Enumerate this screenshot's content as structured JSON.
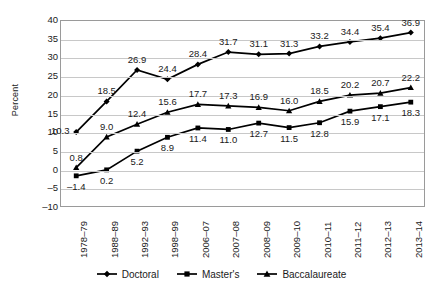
{
  "chart_data": {
    "type": "line",
    "title": "",
    "subtitle": "",
    "xlabel": "",
    "ylabel": "Percent",
    "ylim": [
      -10,
      40
    ],
    "ytick_values": [
      40,
      35,
      30,
      25,
      20,
      15,
      10,
      5,
      0,
      -5,
      -10
    ],
    "ytick_labels": [
      "40",
      "35",
      "30",
      "25",
      "20",
      "15",
      "10",
      "5",
      "0",
      "–5",
      "–10"
    ],
    "grid": "horizontal",
    "legend_position": "bottom-center",
    "categories": [
      "1978–79",
      "1988–89",
      "1992–93",
      "1998–99",
      "2006–07",
      "2007–08",
      "2008–09",
      "2009–10",
      "2010–11",
      "2011–12",
      "2012–13",
      "2013–14"
    ],
    "series": [
      {
        "name": "Doctoral",
        "marker": "diamond",
        "color": "#000000",
        "values": [
          10.3,
          18.5,
          26.9,
          24.4,
          28.4,
          31.7,
          31.1,
          31.3,
          33.2,
          34.4,
          35.4,
          36.9
        ],
        "labels": [
          "10.3",
          "18.5",
          "26.9",
          "24.4",
          "28.4",
          "31.7",
          "31.1",
          "31.3",
          "33.2",
          "34.4",
          "35.4",
          "36.9"
        ],
        "label_placement": [
          "left",
          "above",
          "above",
          "above",
          "above",
          "above",
          "above",
          "above",
          "above",
          "above",
          "above",
          "above"
        ]
      },
      {
        "name": "Master's",
        "marker": "square",
        "color": "#000000",
        "values": [
          -1.4,
          0.2,
          5.2,
          8.9,
          11.4,
          11.0,
          12.7,
          11.5,
          12.8,
          15.9,
          17.1,
          18.3
        ],
        "labels": [
          "–1.4",
          "0.2",
          "5.2",
          "8.9",
          "11.4",
          "11.0",
          "12.7",
          "11.5",
          "12.8",
          "15.9",
          "17.1",
          "18.3"
        ],
        "label_placement": [
          "below",
          "below",
          "below",
          "below",
          "below",
          "below",
          "below",
          "below",
          "below",
          "below",
          "below",
          "below"
        ]
      },
      {
        "name": "Baccalaureate",
        "marker": "triangle",
        "color": "#000000",
        "values": [
          0.8,
          9.0,
          12.4,
          15.6,
          17.7,
          17.3,
          16.9,
          16.0,
          18.5,
          20.2,
          20.7,
          22.2
        ],
        "labels": [
          "0.8",
          "9.0",
          "12.4",
          "15.6",
          "17.7",
          "17.3",
          "16.9",
          "16.0",
          "18.5",
          "20.2",
          "20.7",
          "22.2"
        ],
        "label_placement": [
          "above",
          "above",
          "above",
          "above",
          "above",
          "above",
          "above",
          "above",
          "above",
          "above",
          "above",
          "above"
        ]
      }
    ],
    "legend": [
      {
        "label": "Doctoral",
        "marker": "diamond"
      },
      {
        "label": "Master's",
        "marker": "square"
      },
      {
        "label": "Baccalaureate",
        "marker": "triangle"
      }
    ]
  }
}
